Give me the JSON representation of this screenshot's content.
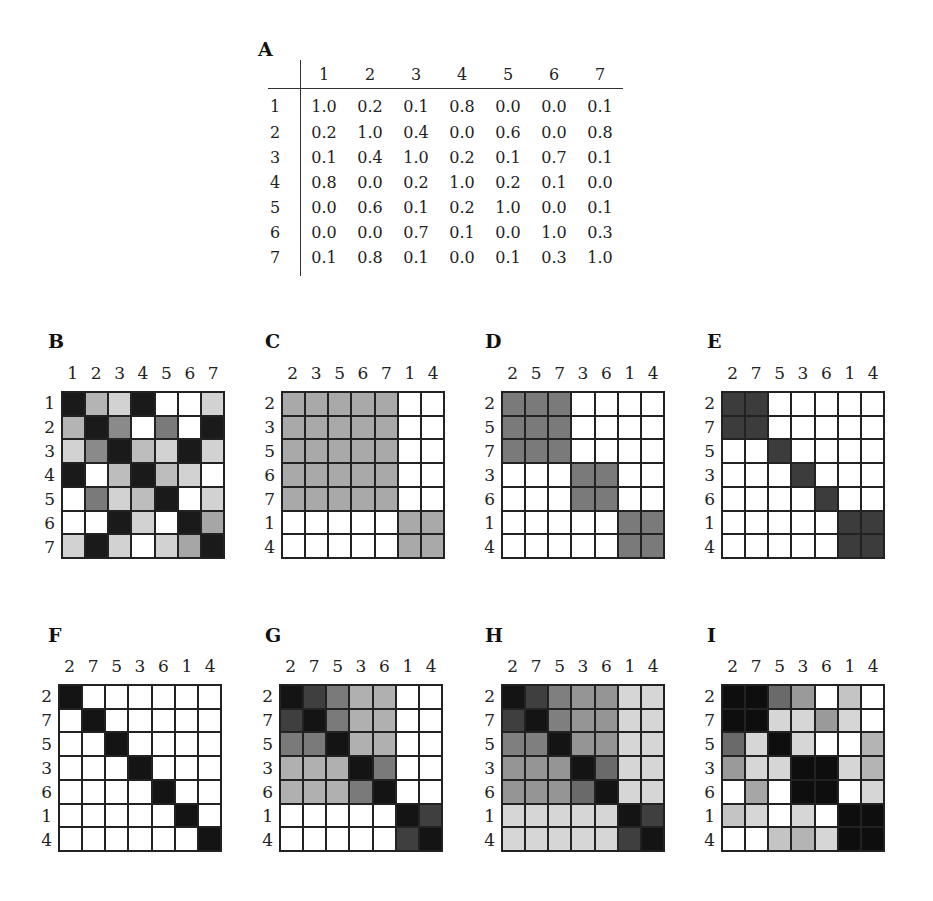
{
  "panels": {
    "A": {
      "label": "A",
      "columns": [
        "1",
        "2",
        "3",
        "4",
        "5",
        "6",
        "7"
      ],
      "rows": [
        {
          "label": "1",
          "values": [
            "1.0",
            "0.2",
            "0.1",
            "0.8",
            "0.0",
            "0.0",
            "0.1"
          ]
        },
        {
          "label": "2",
          "values": [
            "0.2",
            "1.0",
            "0.4",
            "0.0",
            "0.6",
            "0.0",
            "0.8"
          ]
        },
        {
          "label": "3",
          "values": [
            "0.1",
            "0.4",
            "1.0",
            "0.2",
            "0.1",
            "0.7",
            "0.1"
          ]
        },
        {
          "label": "4",
          "values": [
            "0.8",
            "0.0",
            "0.2",
            "1.0",
            "0.2",
            "0.1",
            "0.0"
          ]
        },
        {
          "label": "5",
          "values": [
            "0.0",
            "0.6",
            "0.1",
            "0.2",
            "1.0",
            "0.0",
            "0.1"
          ]
        },
        {
          "label": "6",
          "values": [
            "0.0",
            "0.0",
            "0.7",
            "0.1",
            "0.0",
            "1.0",
            "0.3"
          ]
        },
        {
          "label": "7",
          "values": [
            "0.1",
            "0.8",
            "0.1",
            "0.0",
            "0.1",
            "0.3",
            "1.0"
          ]
        }
      ]
    },
    "B": {
      "label": "B",
      "order": [
        "1",
        "2",
        "3",
        "4",
        "5",
        "6",
        "7"
      ]
    },
    "C": {
      "label": "C",
      "order": [
        "2",
        "3",
        "5",
        "6",
        "7",
        "1",
        "4"
      ]
    },
    "D": {
      "label": "D",
      "order": [
        "2",
        "5",
        "7",
        "3",
        "6",
        "1",
        "4"
      ]
    },
    "E": {
      "label": "E",
      "order": [
        "2",
        "7",
        "5",
        "3",
        "6",
        "1",
        "4"
      ]
    },
    "F": {
      "label": "F",
      "order": [
        "2",
        "7",
        "5",
        "3",
        "6",
        "1",
        "4"
      ]
    },
    "G": {
      "label": "G",
      "order": [
        "2",
        "7",
        "5",
        "3",
        "6",
        "1",
        "4"
      ]
    },
    "H": {
      "label": "H",
      "order": [
        "2",
        "7",
        "5",
        "3",
        "6",
        "1",
        "4"
      ]
    },
    "I": {
      "label": "I",
      "order": [
        "2",
        "7",
        "5",
        "3",
        "6",
        "1",
        "4"
      ]
    }
  },
  "chart_data": [
    {
      "type": "table",
      "title": "A",
      "columns": [
        "1",
        "2",
        "3",
        "4",
        "5",
        "6",
        "7"
      ],
      "rows": [
        "1",
        "2",
        "3",
        "4",
        "5",
        "6",
        "7"
      ],
      "values": [
        [
          1.0,
          0.2,
          0.1,
          0.8,
          0.0,
          0.0,
          0.1
        ],
        [
          0.2,
          1.0,
          0.4,
          0.0,
          0.6,
          0.0,
          0.8
        ],
        [
          0.1,
          0.4,
          1.0,
          0.2,
          0.1,
          0.7,
          0.1
        ],
        [
          0.8,
          0.0,
          0.2,
          1.0,
          0.2,
          0.1,
          0.0
        ],
        [
          0.0,
          0.6,
          0.1,
          0.2,
          1.0,
          0.0,
          0.1
        ],
        [
          0.0,
          0.0,
          0.7,
          0.1,
          0.0,
          1.0,
          0.3
        ],
        [
          0.1,
          0.8,
          0.1,
          0.0,
          0.1,
          0.3,
          1.0
        ]
      ]
    },
    {
      "type": "heatmap",
      "title": "B",
      "x": [
        "1",
        "2",
        "3",
        "4",
        "5",
        "6",
        "7"
      ],
      "y": [
        "1",
        "2",
        "3",
        "4",
        "5",
        "6",
        "7"
      ],
      "colors": [
        [
          "#1a1a1a",
          "#b4b4b4",
          "#d2d2d2",
          "#1a1a1a",
          "#ffffff",
          "#ffffff",
          "#d2d2d2"
        ],
        [
          "#b4b4b4",
          "#1a1a1a",
          "#8a8a8a",
          "#ffffff",
          "#7a7a7a",
          "#ffffff",
          "#1a1a1a"
        ],
        [
          "#d2d2d2",
          "#8a8a8a",
          "#1a1a1a",
          "#bdbdbd",
          "#d2d2d2",
          "#1a1a1a",
          "#d2d2d2"
        ],
        [
          "#1a1a1a",
          "#ffffff",
          "#bdbdbd",
          "#1a1a1a",
          "#bdbdbd",
          "#d2d2d2",
          "#ffffff"
        ],
        [
          "#ffffff",
          "#7a7a7a",
          "#d2d2d2",
          "#bdbdbd",
          "#1a1a1a",
          "#ffffff",
          "#d2d2d2"
        ],
        [
          "#ffffff",
          "#ffffff",
          "#1a1a1a",
          "#d2d2d2",
          "#ffffff",
          "#1a1a1a",
          "#a6a6a6"
        ],
        [
          "#d2d2d2",
          "#1a1a1a",
          "#d2d2d2",
          "#ffffff",
          "#d2d2d2",
          "#a6a6a6",
          "#1a1a1a"
        ]
      ]
    },
    {
      "type": "heatmap",
      "title": "C",
      "x": [
        "2",
        "3",
        "5",
        "6",
        "7",
        "1",
        "4"
      ],
      "y": [
        "2",
        "3",
        "5",
        "6",
        "7",
        "1",
        "4"
      ],
      "blocks": [
        {
          "members": [
            "2",
            "3",
            "5",
            "6",
            "7"
          ],
          "color": "#a9a9a9"
        },
        {
          "members": [
            "1",
            "4"
          ],
          "color": "#a9a9a9"
        }
      ]
    },
    {
      "type": "heatmap",
      "title": "D",
      "x": [
        "2",
        "5",
        "7",
        "3",
        "6",
        "1",
        "4"
      ],
      "y": [
        "2",
        "5",
        "7",
        "3",
        "6",
        "1",
        "4"
      ],
      "blocks": [
        {
          "members": [
            "2",
            "5",
            "7"
          ],
          "color": "#7a7a7a"
        },
        {
          "members": [
            "3",
            "6"
          ],
          "color": "#7a7a7a"
        },
        {
          "members": [
            "1",
            "4"
          ],
          "color": "#7a7a7a"
        }
      ]
    },
    {
      "type": "heatmap",
      "title": "E",
      "x": [
        "2",
        "7",
        "5",
        "3",
        "6",
        "1",
        "4"
      ],
      "y": [
        "2",
        "7",
        "5",
        "3",
        "6",
        "1",
        "4"
      ],
      "blocks": [
        {
          "members": [
            "2",
            "7"
          ],
          "color": "#3c3c3c"
        },
        {
          "members": [
            "5"
          ],
          "color": "#3c3c3c"
        },
        {
          "members": [
            "3"
          ],
          "color": "#3c3c3c"
        },
        {
          "members": [
            "6"
          ],
          "color": "#3c3c3c"
        },
        {
          "members": [
            "1",
            "4"
          ],
          "color": "#3c3c3c"
        }
      ]
    },
    {
      "type": "heatmap",
      "title": "F",
      "x": [
        "2",
        "7",
        "5",
        "3",
        "6",
        "1",
        "4"
      ],
      "y": [
        "2",
        "7",
        "5",
        "3",
        "6",
        "1",
        "4"
      ],
      "blocks": [
        {
          "members": [
            "2"
          ],
          "color": "#141414"
        },
        {
          "members": [
            "7"
          ],
          "color": "#141414"
        },
        {
          "members": [
            "5"
          ],
          "color": "#141414"
        },
        {
          "members": [
            "3"
          ],
          "color": "#141414"
        },
        {
          "members": [
            "6"
          ],
          "color": "#141414"
        },
        {
          "members": [
            "1"
          ],
          "color": "#141414"
        },
        {
          "members": [
            "4"
          ],
          "color": "#141414"
        }
      ]
    },
    {
      "type": "heatmap",
      "title": "G",
      "x": [
        "2",
        "7",
        "5",
        "3",
        "6",
        "1",
        "4"
      ],
      "y": [
        "2",
        "7",
        "5",
        "3",
        "6",
        "1",
        "4"
      ],
      "colors": [
        [
          "#141414",
          "#3f3f3f",
          "#7a7a7a",
          "#b0b0b0",
          "#b0b0b0",
          "#ffffff",
          "#ffffff"
        ],
        [
          "#3f3f3f",
          "#141414",
          "#7a7a7a",
          "#b0b0b0",
          "#b0b0b0",
          "#ffffff",
          "#ffffff"
        ],
        [
          "#7a7a7a",
          "#7a7a7a",
          "#141414",
          "#b0b0b0",
          "#b0b0b0",
          "#ffffff",
          "#ffffff"
        ],
        [
          "#b0b0b0",
          "#b0b0b0",
          "#b0b0b0",
          "#141414",
          "#7a7a7a",
          "#ffffff",
          "#ffffff"
        ],
        [
          "#b0b0b0",
          "#b0b0b0",
          "#b0b0b0",
          "#7a7a7a",
          "#141414",
          "#ffffff",
          "#ffffff"
        ],
        [
          "#ffffff",
          "#ffffff",
          "#ffffff",
          "#ffffff",
          "#ffffff",
          "#141414",
          "#3f3f3f"
        ],
        [
          "#ffffff",
          "#ffffff",
          "#ffffff",
          "#ffffff",
          "#ffffff",
          "#3f3f3f",
          "#141414"
        ]
      ]
    },
    {
      "type": "heatmap",
      "title": "H",
      "x": [
        "2",
        "7",
        "5",
        "3",
        "6",
        "1",
        "4"
      ],
      "y": [
        "2",
        "7",
        "5",
        "3",
        "6",
        "1",
        "4"
      ],
      "colors": [
        [
          "#141414",
          "#3f3f3f",
          "#7f7f7f",
          "#959595",
          "#959595",
          "#d6d6d6",
          "#d6d6d6"
        ],
        [
          "#3f3f3f",
          "#141414",
          "#7f7f7f",
          "#959595",
          "#959595",
          "#d6d6d6",
          "#d6d6d6"
        ],
        [
          "#7f7f7f",
          "#7f7f7f",
          "#141414",
          "#959595",
          "#959595",
          "#d6d6d6",
          "#d6d6d6"
        ],
        [
          "#959595",
          "#959595",
          "#959595",
          "#141414",
          "#6a6a6a",
          "#d6d6d6",
          "#d6d6d6"
        ],
        [
          "#959595",
          "#959595",
          "#959595",
          "#6a6a6a",
          "#141414",
          "#d6d6d6",
          "#d6d6d6"
        ],
        [
          "#d6d6d6",
          "#d6d6d6",
          "#d6d6d6",
          "#d6d6d6",
          "#d6d6d6",
          "#141414",
          "#3f3f3f"
        ],
        [
          "#d6d6d6",
          "#d6d6d6",
          "#d6d6d6",
          "#d6d6d6",
          "#d6d6d6",
          "#3f3f3f",
          "#141414"
        ]
      ]
    },
    {
      "type": "heatmap",
      "title": "I",
      "x": [
        "2",
        "7",
        "5",
        "3",
        "6",
        "1",
        "4"
      ],
      "y": [
        "2",
        "7",
        "5",
        "3",
        "6",
        "1",
        "4"
      ],
      "colors": [
        [
          "#0e0e0e",
          "#0e0e0e",
          "#6a6a6a",
          "#9a9a9a",
          "#ffffff",
          "#c4c4c4",
          "#ffffff"
        ],
        [
          "#0e0e0e",
          "#0e0e0e",
          "#d6d6d6",
          "#d6d6d6",
          "#9a9a9a",
          "#d6d6d6",
          "#ffffff"
        ],
        [
          "#6a6a6a",
          "#d6d6d6",
          "#0e0e0e",
          "#d6d6d6",
          "#ffffff",
          "#ffffff",
          "#b4b4b4"
        ],
        [
          "#9a9a9a",
          "#d6d6d6",
          "#d6d6d6",
          "#0e0e0e",
          "#0e0e0e",
          "#d6d6d6",
          "#b4b4b4"
        ],
        [
          "#ffffff",
          "#a6a6a6",
          "#ffffff",
          "#0e0e0e",
          "#0e0e0e",
          "#ffffff",
          "#d6d6d6"
        ],
        [
          "#c4c4c4",
          "#d6d6d6",
          "#ffffff",
          "#d6d6d6",
          "#ffffff",
          "#0e0e0e",
          "#0e0e0e"
        ],
        [
          "#ffffff",
          "#ffffff",
          "#c4c4c4",
          "#b4b4b4",
          "#d6d6d6",
          "#0e0e0e",
          "#0e0e0e"
        ]
      ]
    }
  ]
}
